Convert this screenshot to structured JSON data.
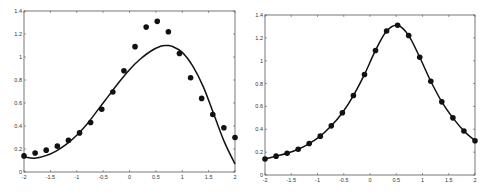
{
  "chart_data": [
    {
      "type": "scatter",
      "title": "",
      "xlabel": "",
      "ylabel": "",
      "xlim": [
        -2,
        2
      ],
      "ylim": [
        0,
        1.4
      ],
      "grid": false,
      "legend": null,
      "xticks": [
        "-2",
        "-1.5",
        "-1",
        "-0.5",
        "0",
        "0.5",
        "1",
        "1.5",
        "2"
      ],
      "yticks": [
        "0",
        "0.2",
        "0.4",
        "0.6",
        "0.8",
        "1",
        "1.2",
        "1.4"
      ],
      "series": [
        {
          "name": "data points",
          "style": "markers",
          "x": [
            -2.0,
            -1.789,
            -1.579,
            -1.368,
            -1.158,
            -0.947,
            -0.737,
            -0.526,
            -0.316,
            -0.105,
            0.105,
            0.316,
            0.526,
            0.737,
            0.947,
            1.158,
            1.368,
            1.579,
            1.789,
            2.0
          ],
          "y": [
            0.14,
            0.165,
            0.19,
            0.225,
            0.275,
            0.34,
            0.43,
            0.545,
            0.695,
            0.88,
            1.09,
            1.26,
            1.31,
            1.22,
            1.03,
            0.82,
            0.64,
            0.5,
            0.385,
            0.3
          ]
        },
        {
          "name": "fit curve",
          "style": "line",
          "x": [
            -2.0,
            -1.8,
            -1.6,
            -1.4,
            -1.2,
            -1.0,
            -0.8,
            -0.6,
            -0.4,
            -0.2,
            0.0,
            0.2,
            0.4,
            0.6,
            0.7,
            0.8,
            1.0,
            1.2,
            1.4,
            1.6,
            1.8,
            2.0
          ],
          "y": [
            0.13,
            0.12,
            0.14,
            0.18,
            0.24,
            0.32,
            0.42,
            0.54,
            0.66,
            0.78,
            0.89,
            0.98,
            1.05,
            1.095,
            1.1,
            1.095,
            1.04,
            0.92,
            0.74,
            0.5,
            0.26,
            0.07
          ]
        }
      ]
    },
    {
      "type": "line",
      "title": "",
      "xlabel": "",
      "ylabel": "",
      "xlim": [
        -2,
        2
      ],
      "ylim": [
        0,
        1.4
      ],
      "grid": false,
      "legend": null,
      "xticks": [
        "-2",
        "-1.5",
        "-1",
        "-0.5",
        "0",
        "0.5",
        "1",
        "1.5",
        "2"
      ],
      "yticks": [
        "0",
        "0.2",
        "0.4",
        "0.6",
        "0.8",
        "1",
        "1.2",
        "1.4"
      ],
      "series": [
        {
          "name": "data points with interpolating curve",
          "style": "line+markers",
          "x": [
            -2.0,
            -1.789,
            -1.579,
            -1.368,
            -1.158,
            -0.947,
            -0.737,
            -0.526,
            -0.316,
            -0.105,
            0.105,
            0.316,
            0.526,
            0.737,
            0.947,
            1.158,
            1.368,
            1.579,
            1.789,
            2.0
          ],
          "y": [
            0.14,
            0.165,
            0.19,
            0.225,
            0.275,
            0.34,
            0.43,
            0.545,
            0.695,
            0.88,
            1.09,
            1.26,
            1.31,
            1.22,
            1.03,
            0.82,
            0.64,
            0.5,
            0.385,
            0.3
          ]
        }
      ]
    }
  ]
}
